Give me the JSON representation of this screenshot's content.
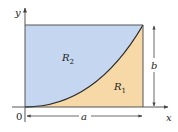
{
  "diagram": {
    "type": "region-area",
    "colors": {
      "region_upper": "#c5d7f0",
      "region_lower": "#f6d9a6",
      "curve": "#2a2a2a",
      "axis": "#555555",
      "border": "#555555"
    },
    "labels": {
      "y_axis": "y",
      "x_axis": "x",
      "origin": "0",
      "region_upper": "R",
      "region_upper_sub": "2",
      "region_lower": "R",
      "region_lower_sub": "1",
      "width": "a",
      "height": "b"
    }
  }
}
